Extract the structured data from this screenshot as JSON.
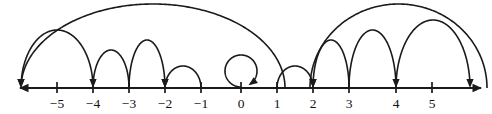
{
  "figure": {
    "type": "number-line-diagram",
    "axis": {
      "orientation": "horizontal",
      "y_pixel": 88,
      "x_start_pixel": 20,
      "x_end_pixel": 481,
      "unit_pixels": 36,
      "origin_pixel": 241,
      "left_arrow": true,
      "right_arrow": true,
      "color": "#1a1a1a"
    },
    "ticks": [
      {
        "value": -5,
        "label": "−5",
        "x": 57
      },
      {
        "value": -4,
        "label": "−4",
        "x": 93
      },
      {
        "value": -3,
        "label": "−3",
        "x": 129
      },
      {
        "value": -2,
        "label": "−2",
        "x": 165
      },
      {
        "value": -1,
        "label": "−1",
        "x": 201
      },
      {
        "value": 0,
        "label": "0",
        "x": 241
      },
      {
        "value": 1,
        "label": "1",
        "x": 277
      },
      {
        "value": 2,
        "label": "2",
        "x": 313
      },
      {
        "value": 3,
        "label": "3",
        "x": 349
      },
      {
        "value": 4,
        "label": "4",
        "x": 396
      },
      {
        "value": 5,
        "label": "5",
        "x": 432
      }
    ],
    "tick_label_y": 108,
    "arcs": [
      {
        "id": "arc-a",
        "from": 1.2,
        "to": -6.2,
        "from_x": 285,
        "to_x": 21,
        "direction": "leftward",
        "arrowhead": "left-end",
        "radius_y": 84,
        "clipped_top": true,
        "note": "long arc sweeping from right, clipped at top of figure, arrowhead at far left"
      },
      {
        "id": "arc-b",
        "from": -4,
        "to": -6.2,
        "from_x": 93,
        "to_x": 21,
        "direction": "leftward",
        "arrowhead": "left-end",
        "radius_y": 58,
        "clipped_top": false,
        "note": "arc from -4 landing left of -5"
      },
      {
        "id": "arc-c",
        "from": -3,
        "to": -4,
        "from_x": 129,
        "to_x": 93,
        "direction": "leftward",
        "arrowhead": "left-end",
        "radius_y": 38,
        "clipped_top": false,
        "note": "arc from -3 to -4"
      },
      {
        "id": "arc-d",
        "from": -3,
        "to": -2,
        "from_x": 129,
        "to_x": 165,
        "direction": "rightward",
        "arrowhead": "right-end",
        "radius_y": 48,
        "clipped_top": false,
        "note": "arc from -3 to -2"
      },
      {
        "id": "arc-e",
        "from": -1,
        "to": -2,
        "from_x": 201,
        "to_x": 165,
        "direction": "leftward",
        "arrowhead": "left-end",
        "radius_y": 22,
        "clipped_top": false,
        "note": "small arc from -1 back to -2"
      },
      {
        "id": "arc-f",
        "from": 1,
        "to": 2,
        "from_x": 277,
        "to_x": 313,
        "direction": "rightward",
        "arrowhead": "right-end",
        "radius_y": 22,
        "clipped_top": false,
        "note": "small arc from 1 to 2"
      },
      {
        "id": "arc-g",
        "from": 3,
        "to": 2,
        "from_x": 349,
        "to_x": 313,
        "direction": "leftward",
        "arrowhead": "left-end",
        "radius_y": 48,
        "clipped_top": false,
        "note": "arc from 3 back to 2"
      },
      {
        "id": "arc-h",
        "from": 3,
        "to": 4,
        "from_x": 349,
        "to_x": 396,
        "direction": "rightward",
        "arrowhead": "right-end",
        "radius_y": 58,
        "clipped_top": false,
        "note": "arc from 3 to 4"
      },
      {
        "id": "arc-i",
        "from": 4,
        "to": 6.9,
        "from_x": 396,
        "to_x": 470,
        "direction": "rightward",
        "arrowhead": "right-end",
        "radius_y": 68,
        "clipped_top": false,
        "note": "arc from 4 landing right of 5"
      },
      {
        "id": "arc-j",
        "from": 1.9,
        "to": 7.3,
        "from_x": 310,
        "to_x": 487,
        "direction": "rightward",
        "arrowhead": "none",
        "radius_y": 84,
        "clipped_top": true,
        "note": "long arc rising from left, clipped at top and right edge"
      }
    ],
    "loop": {
      "id": "loop-zero",
      "at_value": 0,
      "center_x": 241,
      "center_y": 71,
      "radius": 16,
      "direction": "counterclockwise",
      "arrowhead": "down-right-at-base",
      "note": "self-loop at 0"
    }
  }
}
